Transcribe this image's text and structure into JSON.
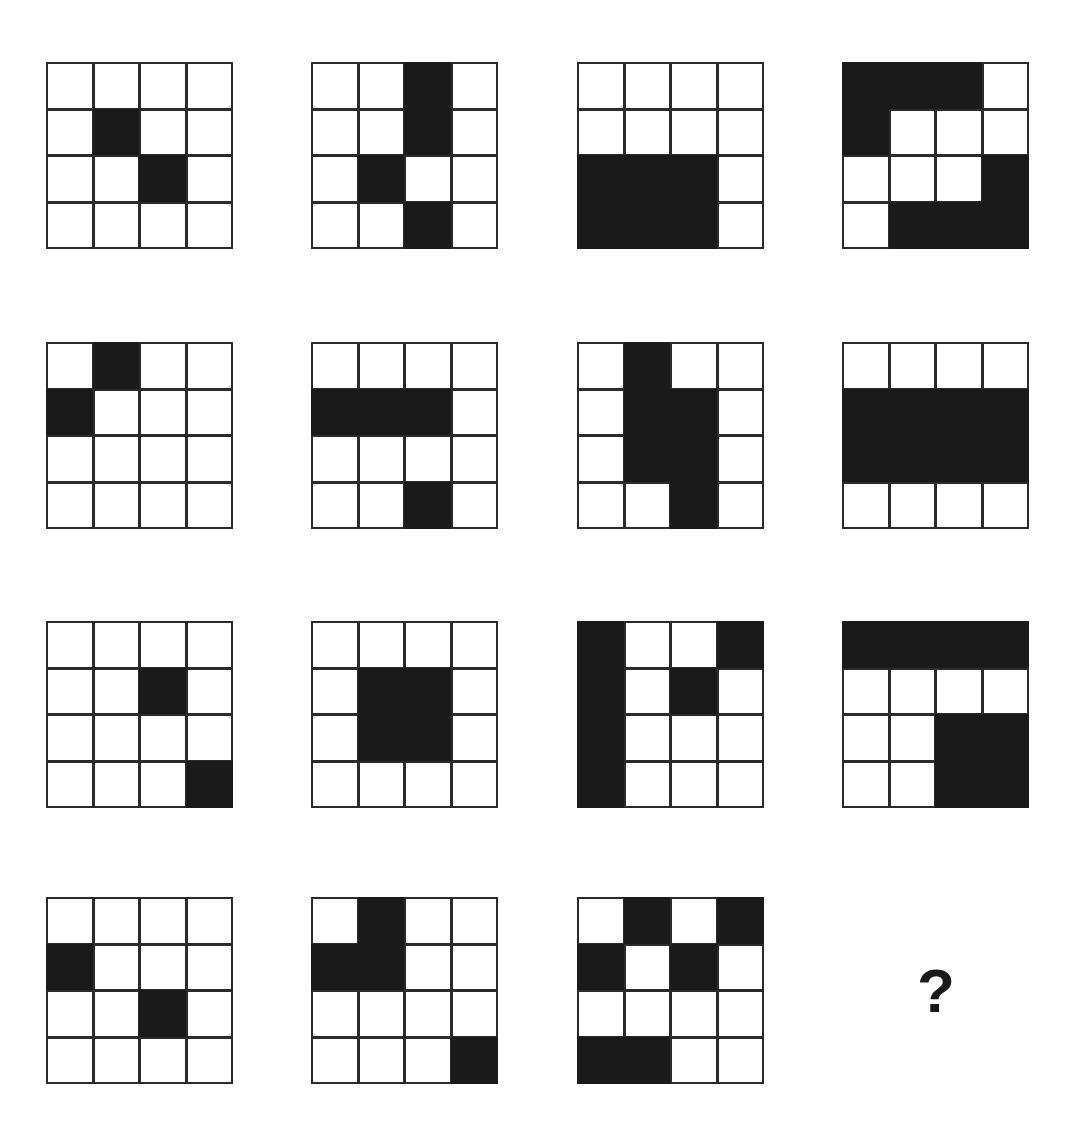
{
  "page": {
    "title": "Matrix Reasoning Pattern Puzzle",
    "background_color": "#ffffff",
    "fill_color": "#1a1a1a",
    "line_color": "#2b2b2b",
    "grid_rows": 4,
    "grid_cols": 4,
    "figure_rows": 4,
    "figure_cols": 4,
    "total_figures": 15
  },
  "answer": {
    "label": "?",
    "name": "missing-figure-placeholder"
  },
  "figures": [
    {
      "index": 1,
      "row": 1,
      "col": 1,
      "x": 47,
      "y": 63,
      "size": 186,
      "filled_cells": [
        [
          1,
          1
        ],
        [
          2,
          2
        ]
      ],
      "pattern": [
        [
          0,
          0,
          0,
          0
        ],
        [
          0,
          1,
          0,
          0
        ],
        [
          0,
          0,
          1,
          0
        ],
        [
          0,
          0,
          0,
          0
        ]
      ]
    },
    {
      "index": 2,
      "row": 1,
      "col": 2,
      "x": 312,
      "y": 63,
      "size": 186,
      "filled_cells": [
        [
          0,
          2
        ],
        [
          1,
          2
        ],
        [
          2,
          1
        ],
        [
          3,
          2
        ]
      ],
      "pattern": [
        [
          0,
          0,
          1,
          0
        ],
        [
          0,
          0,
          1,
          0
        ],
        [
          0,
          1,
          0,
          0
        ],
        [
          0,
          0,
          1,
          0
        ]
      ]
    },
    {
      "index": 3,
      "row": 1,
      "col": 3,
      "x": 578,
      "y": 63,
      "size": 186,
      "filled_cells": [
        [
          2,
          0
        ],
        [
          2,
          1
        ],
        [
          2,
          2
        ],
        [
          3,
          0
        ],
        [
          3,
          1
        ],
        [
          3,
          2
        ]
      ],
      "pattern": [
        [
          0,
          0,
          0,
          0
        ],
        [
          0,
          0,
          0,
          0
        ],
        [
          1,
          1,
          1,
          0
        ],
        [
          1,
          1,
          1,
          0
        ]
      ]
    },
    {
      "index": 4,
      "row": 1,
      "col": 4,
      "x": 843,
      "y": 63,
      "size": 186,
      "filled_cells": [
        [
          0,
          0
        ],
        [
          0,
          1
        ],
        [
          0,
          2
        ],
        [
          1,
          0
        ],
        [
          2,
          3
        ],
        [
          3,
          1
        ],
        [
          3,
          2
        ],
        [
          3,
          3
        ]
      ],
      "pattern": [
        [
          1,
          1,
          1,
          0
        ],
        [
          1,
          0,
          0,
          0
        ],
        [
          0,
          0,
          0,
          1
        ],
        [
          0,
          1,
          1,
          1
        ]
      ]
    },
    {
      "index": 5,
      "row": 2,
      "col": 1,
      "x": 47,
      "y": 343,
      "size": 186,
      "filled_cells": [
        [
          0,
          1
        ],
        [
          1,
          0
        ]
      ],
      "pattern": [
        [
          0,
          1,
          0,
          0
        ],
        [
          1,
          0,
          0,
          0
        ],
        [
          0,
          0,
          0,
          0
        ],
        [
          0,
          0,
          0,
          0
        ]
      ]
    },
    {
      "index": 6,
      "row": 2,
      "col": 2,
      "x": 312,
      "y": 343,
      "size": 186,
      "filled_cells": [
        [
          1,
          0
        ],
        [
          1,
          1
        ],
        [
          1,
          2
        ],
        [
          3,
          2
        ]
      ],
      "pattern": [
        [
          0,
          0,
          0,
          0
        ],
        [
          1,
          1,
          1,
          0
        ],
        [
          0,
          0,
          0,
          0
        ],
        [
          0,
          0,
          1,
          0
        ]
      ]
    },
    {
      "index": 7,
      "row": 2,
      "col": 3,
      "x": 578,
      "y": 343,
      "size": 186,
      "filled_cells": [
        [
          0,
          1
        ],
        [
          1,
          1
        ],
        [
          1,
          2
        ],
        [
          2,
          1
        ],
        [
          2,
          2
        ],
        [
          3,
          2
        ]
      ],
      "pattern": [
        [
          0,
          1,
          0,
          0
        ],
        [
          0,
          1,
          1,
          0
        ],
        [
          0,
          1,
          1,
          0
        ],
        [
          0,
          0,
          1,
          0
        ]
      ]
    },
    {
      "index": 8,
      "row": 2,
      "col": 4,
      "x": 843,
      "y": 343,
      "size": 186,
      "filled_cells": [
        [
          1,
          0
        ],
        [
          1,
          1
        ],
        [
          1,
          2
        ],
        [
          1,
          3
        ],
        [
          2,
          0
        ],
        [
          2,
          1
        ],
        [
          2,
          2
        ],
        [
          2,
          3
        ]
      ],
      "pattern": [
        [
          0,
          0,
          0,
          0
        ],
        [
          1,
          1,
          1,
          1
        ],
        [
          1,
          1,
          1,
          1
        ],
        [
          0,
          0,
          0,
          0
        ]
      ]
    },
    {
      "index": 9,
      "row": 3,
      "col": 1,
      "x": 47,
      "y": 622,
      "size": 186,
      "filled_cells": [
        [
          1,
          2
        ],
        [
          3,
          3
        ]
      ],
      "pattern": [
        [
          0,
          0,
          0,
          0
        ],
        [
          0,
          0,
          1,
          0
        ],
        [
          0,
          0,
          0,
          0
        ],
        [
          0,
          0,
          0,
          1
        ]
      ]
    },
    {
      "index": 10,
      "row": 3,
      "col": 2,
      "x": 312,
      "y": 622,
      "size": 186,
      "filled_cells": [
        [
          1,
          1
        ],
        [
          1,
          2
        ],
        [
          2,
          1
        ],
        [
          2,
          2
        ]
      ],
      "pattern": [
        [
          0,
          0,
          0,
          0
        ],
        [
          0,
          1,
          1,
          0
        ],
        [
          0,
          1,
          1,
          0
        ],
        [
          0,
          0,
          0,
          0
        ]
      ]
    },
    {
      "index": 11,
      "row": 3,
      "col": 3,
      "x": 578,
      "y": 622,
      "size": 186,
      "filled_cells": [
        [
          0,
          0
        ],
        [
          0,
          3
        ],
        [
          1,
          0
        ],
        [
          1,
          2
        ],
        [
          2,
          0
        ],
        [
          3,
          0
        ]
      ],
      "pattern": [
        [
          1,
          0,
          0,
          1
        ],
        [
          1,
          0,
          1,
          0
        ],
        [
          1,
          0,
          0,
          0
        ],
        [
          1,
          0,
          0,
          0
        ]
      ]
    },
    {
      "index": 12,
      "row": 3,
      "col": 4,
      "x": 843,
      "y": 622,
      "size": 186,
      "filled_cells": [
        [
          0,
          0
        ],
        [
          0,
          1
        ],
        [
          0,
          2
        ],
        [
          0,
          3
        ],
        [
          2,
          2
        ],
        [
          2,
          3
        ],
        [
          3,
          2
        ],
        [
          3,
          3
        ]
      ],
      "pattern": [
        [
          1,
          1,
          1,
          1
        ],
        [
          0,
          0,
          0,
          0
        ],
        [
          0,
          0,
          1,
          1
        ],
        [
          0,
          0,
          1,
          1
        ]
      ]
    },
    {
      "index": 13,
      "row": 4,
      "col": 1,
      "x": 47,
      "y": 898,
      "size": 186,
      "filled_cells": [
        [
          1,
          0
        ],
        [
          2,
          2
        ]
      ],
      "pattern": [
        [
          0,
          0,
          0,
          0
        ],
        [
          1,
          0,
          0,
          0
        ],
        [
          0,
          0,
          1,
          0
        ],
        [
          0,
          0,
          0,
          0
        ]
      ]
    },
    {
      "index": 14,
      "row": 4,
      "col": 2,
      "x": 312,
      "y": 898,
      "size": 186,
      "filled_cells": [
        [
          0,
          1
        ],
        [
          1,
          0
        ],
        [
          1,
          1
        ],
        [
          3,
          3
        ]
      ],
      "pattern": [
        [
          0,
          1,
          0,
          0
        ],
        [
          1,
          1,
          0,
          0
        ],
        [
          0,
          0,
          0,
          0
        ],
        [
          0,
          0,
          0,
          1
        ]
      ]
    },
    {
      "index": 15,
      "row": 4,
      "col": 3,
      "x": 578,
      "y": 898,
      "size": 186,
      "filled_cells": [
        [
          0,
          1
        ],
        [
          0,
          3
        ],
        [
          1,
          0
        ],
        [
          1,
          2
        ],
        [
          3,
          0
        ],
        [
          3,
          1
        ]
      ],
      "pattern": [
        [
          0,
          1,
          0,
          1
        ],
        [
          1,
          0,
          1,
          0
        ],
        [
          0,
          0,
          0,
          0
        ],
        [
          1,
          1,
          0,
          0
        ]
      ]
    }
  ],
  "answer_position": {
    "row": 4,
    "col": 4,
    "x": 843,
    "y": 898,
    "size": 186
  }
}
